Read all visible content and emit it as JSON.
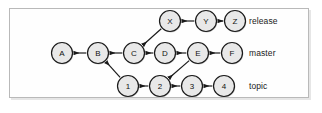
{
  "figure": {
    "kind": "git-commit-graph",
    "frame_color": "#b9b9b9",
    "node_fill": "#e8e8e8",
    "node_stroke": "#1a1a1a",
    "edge_color": "#1a1a1a",
    "background": "#ffffff"
  },
  "branches": [
    {
      "name": "release",
      "label": "release",
      "label_x": 249,
      "label_y": 21,
      "row_y": 21,
      "commits": [
        {
          "id": "X",
          "label": "X",
          "cx": 170,
          "cy": 21
        },
        {
          "id": "Y",
          "label": "Y",
          "cx": 206,
          "cy": 21
        },
        {
          "id": "Z",
          "label": "Z",
          "cx": 235,
          "cy": 21
        }
      ]
    },
    {
      "name": "master",
      "label": "master",
      "label_x": 249,
      "label_y": 53,
      "row_y": 53,
      "commits": [
        {
          "id": "A",
          "label": "A",
          "cx": 62,
          "cy": 53
        },
        {
          "id": "B",
          "label": "B",
          "cx": 98,
          "cy": 53
        },
        {
          "id": "C",
          "label": "C",
          "cx": 134,
          "cy": 53
        },
        {
          "id": "D",
          "label": "D",
          "cx": 165,
          "cy": 53
        },
        {
          "id": "E",
          "label": "E",
          "cx": 198,
          "cy": 53
        },
        {
          "id": "F",
          "label": "F",
          "cx": 232,
          "cy": 53
        }
      ]
    },
    {
      "name": "topic",
      "label": "topic",
      "label_x": 249,
      "label_y": 86,
      "row_y": 86,
      "commits": [
        {
          "id": "1",
          "label": "1",
          "cx": 128,
          "cy": 86
        },
        {
          "id": "2",
          "label": "2",
          "cx": 160,
          "cy": 86
        },
        {
          "id": "3",
          "label": "3",
          "cx": 192,
          "cy": 86
        },
        {
          "id": "4",
          "label": "4",
          "cx": 224,
          "cy": 86
        }
      ]
    }
  ],
  "edges": [
    {
      "from": "B",
      "to": "A",
      "kind": "straight"
    },
    {
      "from": "C",
      "to": "B",
      "kind": "straight"
    },
    {
      "from": "D",
      "to": "C",
      "kind": "straight"
    },
    {
      "from": "E",
      "to": "D",
      "kind": "straight"
    },
    {
      "from": "F",
      "to": "E",
      "kind": "straight"
    },
    {
      "from": "Y",
      "to": "X",
      "kind": "straight"
    },
    {
      "from": "Z",
      "to": "Y",
      "kind": "straight"
    },
    {
      "from": "2",
      "to": "1",
      "kind": "straight"
    },
    {
      "from": "3",
      "to": "2",
      "kind": "straight"
    },
    {
      "from": "4",
      "to": "3",
      "kind": "straight"
    },
    {
      "from": "X",
      "to": "C",
      "kind": "diagonal"
    },
    {
      "from": "1",
      "to": "B",
      "kind": "diagonal"
    },
    {
      "from": "E",
      "to": "2",
      "kind": "diagonal"
    }
  ],
  "geometry": {
    "node_radius": 10.5,
    "stroke_width": 1.2
  }
}
